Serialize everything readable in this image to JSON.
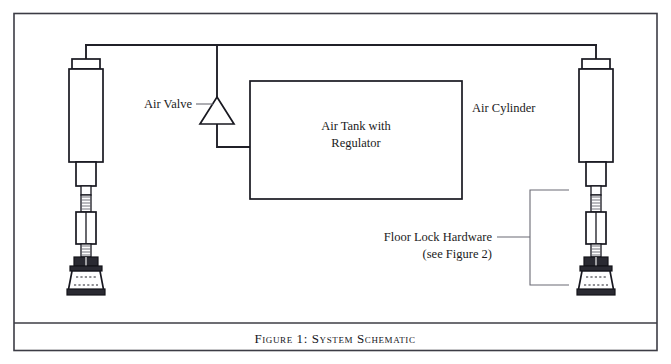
{
  "figure": {
    "caption": "Figure 1:  System Schematic",
    "caption_number": "Figure 1:",
    "caption_title": "System Schematic"
  },
  "labels": {
    "air_valve": "Air Valve",
    "air_cylinder": "Air Cylinder",
    "tank_line1": "Air Tank with",
    "tank_line2": "Regulator",
    "floor_lock_line1": "Floor Lock Hardware",
    "floor_lock_line2": "(see Figure 2)"
  },
  "components": [
    {
      "name": "air-tank-with-regulator",
      "label": "Air Tank with Regulator"
    },
    {
      "name": "air-valve",
      "label": "Air Valve"
    },
    {
      "name": "air-cylinder-left",
      "label": "Air Cylinder"
    },
    {
      "name": "air-cylinder-right",
      "label": "Air Cylinder"
    },
    {
      "name": "floor-lock-hardware",
      "label": "Floor Lock Hardware (see Figure 2)"
    }
  ],
  "colors": {
    "ink": "#181820",
    "frame": "#3c3c45",
    "leader": "#6a6a74",
    "background": "#ffffff"
  }
}
